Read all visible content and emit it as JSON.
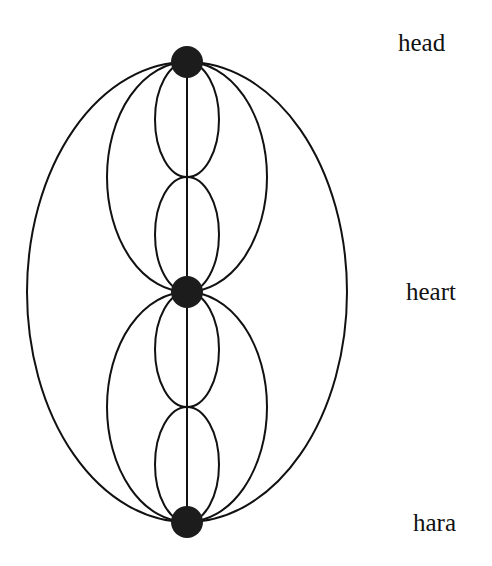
{
  "diagram": {
    "title": "",
    "labels": {
      "head": "head",
      "heart": "heart",
      "hara": "hara"
    },
    "nodes": [
      {
        "id": "head",
        "cx": 187,
        "cy": 62,
        "r": 16
      },
      {
        "id": "heart",
        "cx": 187,
        "cy": 292,
        "r": 16
      },
      {
        "id": "hara",
        "cx": 187,
        "cy": 522,
        "r": 16
      }
    ],
    "connections": {
      "center_line": {
        "from": "head",
        "to": "hara"
      },
      "outer_ellipse": {
        "from": "head",
        "to": "hara",
        "rx": 160
      },
      "medium_ellipses": [
        {
          "from": "head",
          "to": "heart",
          "rx": 80
        },
        {
          "from": "heart",
          "to": "hara",
          "rx": 80
        }
      ],
      "small_ellipses": [
        {
          "from_y": 62,
          "to_y": 177,
          "rx": 32
        },
        {
          "from_y": 177,
          "to_y": 292,
          "rx": 32
        },
        {
          "from_y": 292,
          "to_y": 407,
          "rx": 32
        },
        {
          "from_y": 407,
          "to_y": 522,
          "rx": 32
        }
      ]
    },
    "colors": {
      "background": "#ffffff",
      "line": "#111111",
      "node": "#1c1c1c",
      "text": "#111111"
    }
  }
}
